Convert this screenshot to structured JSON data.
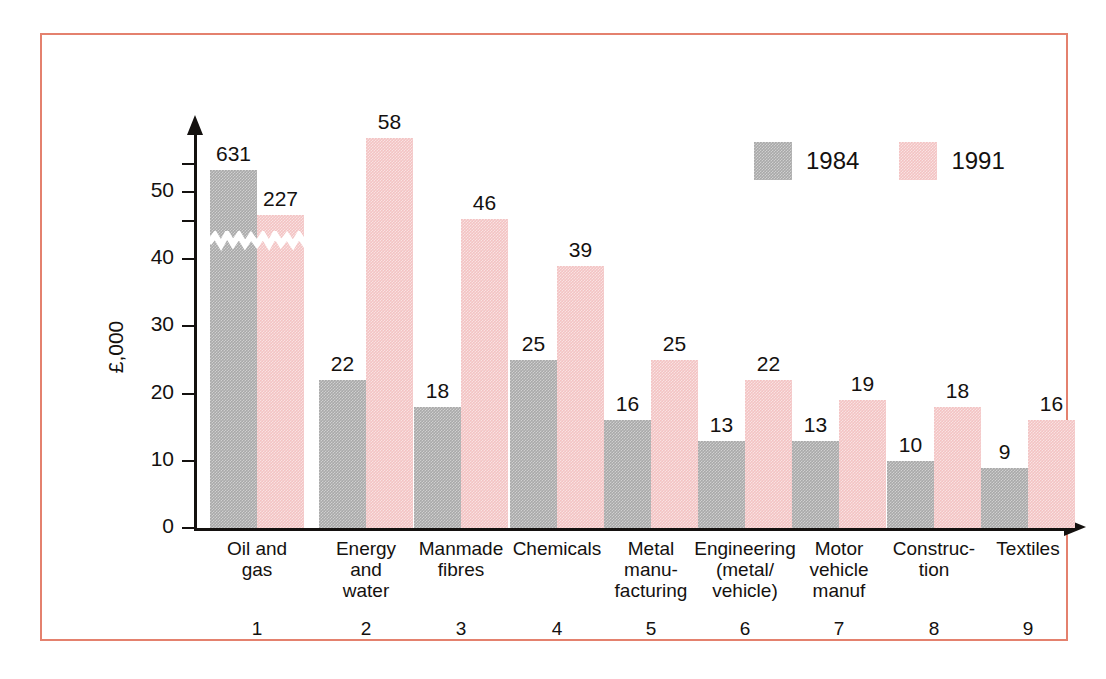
{
  "chart_data": {
    "type": "bar",
    "title": "",
    "xlabel": "",
    "ylabel": "£,000",
    "ylim": [
      0,
      60
    ],
    "grid": false,
    "legend_position": "top-right",
    "note": "Y axis is broken: the 1984 'Oil and gas' bar (631) and the 1991 'Oil and gas' bar (227) are truncated, marked by a white zigzag band.",
    "categories": [
      "Oil and\ngas",
      "Energy\nand\nwater",
      "Manmade\nfibres",
      "Chemicals",
      "Metal\nmanu-\nfacturing",
      "Engineering\n(metal/\nvehicle)",
      "Motor\nvehicle\nmanuf",
      "Construc-\ntion",
      "Textiles"
    ],
    "category_indices": [
      "1",
      "2",
      "3",
      "4",
      "5",
      "6",
      "7",
      "8",
      "9"
    ],
    "series": [
      {
        "name": "1984",
        "color": "#a9a9a9",
        "values": [
          631,
          22,
          18,
          25,
          16,
          13,
          13,
          10,
          9
        ],
        "labels": [
          "631",
          "22",
          "18",
          "25",
          "16",
          "13",
          "13",
          "10",
          "9"
        ]
      },
      {
        "name": "1991",
        "color": "#f3c3c3",
        "values": [
          227,
          58,
          46,
          39,
          25,
          22,
          19,
          18,
          16
        ],
        "labels": [
          "227",
          "58",
          "46",
          "39",
          "25",
          "22",
          "19",
          "18",
          "16"
        ]
      }
    ],
    "y_ticks": [
      "50",
      "40",
      "30",
      "20",
      "10",
      "0"
    ],
    "y_tick_values": [
      50,
      40,
      30,
      20,
      10,
      0
    ]
  },
  "legend": {
    "items": [
      {
        "label": "1984",
        "color": "#a9a9a9",
        "swatch_name": "legend-swatch-1984"
      },
      {
        "label": "1991",
        "color": "#f3c3c3",
        "swatch_name": "legend-swatch-1991"
      }
    ]
  },
  "frame": {
    "border_color": "#e4816e"
  }
}
